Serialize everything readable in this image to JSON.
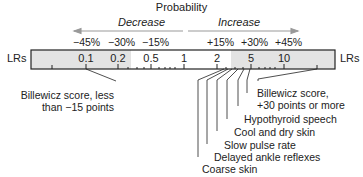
{
  "title": "Probability",
  "direction_labels": {
    "decrease": "Decrease",
    "increase": "Increase"
  },
  "probability_changes": {
    "decrease": [
      "−45%",
      "−30%",
      "−15%"
    ],
    "increase": [
      "+15%",
      "+30%",
      "+45%"
    ]
  },
  "axis": {
    "left_label": "LRs",
    "right_label": "LRs",
    "ticks": [
      "0.1",
      "0.2",
      "0.5",
      "1",
      "2",
      "5",
      "10"
    ]
  },
  "colors": {
    "shaded": "#e3e3e3",
    "line": "#222222",
    "arrow": "#999999"
  },
  "findings_low": [
    {
      "label_line1": "Billewicz score, less",
      "label_line2": "than −15 points"
    }
  ],
  "findings_high": [
    {
      "label_line1": "Billewicz score,",
      "label_line2": "+30 points or more"
    },
    {
      "label": "Hypothyroid speech"
    },
    {
      "label": "Cool and dry skin"
    },
    {
      "label": "Slow pulse rate"
    },
    {
      "label": "Delayed ankle reflexes"
    },
    {
      "label": "Coarse skin"
    }
  ]
}
